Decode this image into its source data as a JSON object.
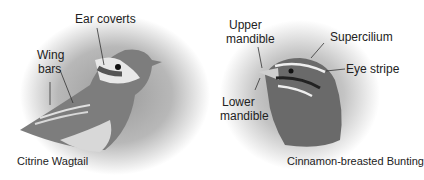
{
  "left_panel": {
    "species": "Citrine Wagtail",
    "labels": {
      "ear_coverts": "Ear coverts",
      "wing_bars_1": "Wing",
      "wing_bars_2": "bars"
    }
  },
  "right_panel": {
    "species": "Cinnamon-breasted Bunting",
    "labels": {
      "upper_mandible_1": "Upper",
      "upper_mandible_2": "mandible",
      "lower_mandible_1": "Lower",
      "lower_mandible_2": "mandible",
      "supercilium": "Supercilium",
      "eye_stripe": "Eye stripe"
    }
  }
}
